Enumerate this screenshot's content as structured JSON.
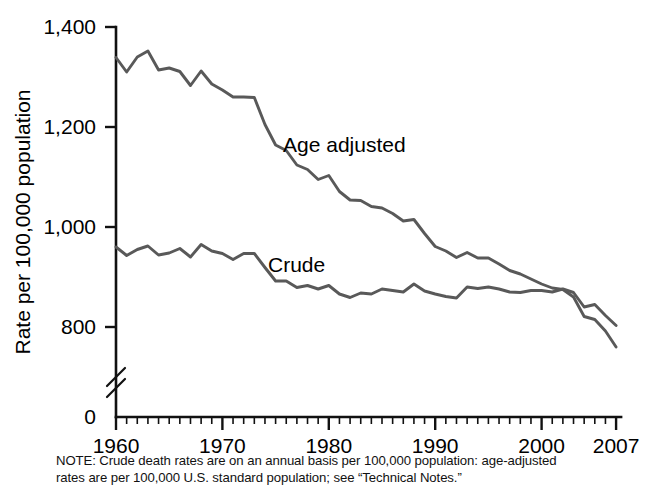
{
  "chart_data": {
    "type": "line",
    "title": "",
    "subtitle": "",
    "xlabel": "",
    "ylabel": "Rate per 100,000 population",
    "xlim": [
      1960,
      2007
    ],
    "ylim": [
      750,
      1400
    ],
    "yzero_label": "0",
    "axis_break": true,
    "grid": false,
    "legend_position": "inline-labels",
    "y_ticks": [
      800,
      1000,
      1200,
      1400
    ],
    "y_tick_labels": [
      "800",
      "1,000",
      "1,200",
      "1,400"
    ],
    "x_ticks": [
      1960,
      1970,
      1980,
      1990,
      2000,
      2007
    ],
    "x_tick_labels": [
      "1960",
      "1970",
      "1980",
      "1990",
      "2000",
      "2007"
    ],
    "x_minor_tick_interval": 1,
    "x": [
      1960,
      1961,
      1962,
      1963,
      1964,
      1965,
      1966,
      1967,
      1968,
      1969,
      1970,
      1971,
      1972,
      1973,
      1974,
      1975,
      1976,
      1977,
      1978,
      1979,
      1980,
      1981,
      1982,
      1983,
      1984,
      1985,
      1986,
      1987,
      1988,
      1989,
      1990,
      1991,
      1992,
      1993,
      1994,
      1995,
      1996,
      1997,
      1998,
      1999,
      2000,
      2001,
      2002,
      2003,
      2004,
      2005,
      2006,
      2007
    ],
    "series": [
      {
        "name": "Age adjusted",
        "label": "Age adjusted",
        "color": "#595959",
        "values": [
          1339,
          1310,
          1340,
          1352,
          1314,
          1318,
          1311,
          1283,
          1312,
          1286,
          1274,
          1260,
          1260,
          1259,
          1205,
          1164,
          1153,
          1124,
          1115,
          1095,
          1103,
          1071,
          1054,
          1053,
          1041,
          1038,
          1027,
          1012,
          1015,
          987,
          961,
          952,
          939,
          949,
          938,
          938,
          926,
          913,
          906,
          896,
          886,
          878,
          875,
          860,
          821,
          815,
          792,
          760
        ]
      },
      {
        "name": "Crude",
        "label": "Crude",
        "color": "#595959",
        "values": [
          960,
          943,
          955,
          962,
          944,
          948,
          957,
          940,
          965,
          952,
          947,
          935,
          947,
          947,
          919,
          892,
          892,
          879,
          883,
          876,
          883,
          866,
          859,
          868,
          866,
          876,
          873,
          870,
          886,
          872,
          866,
          861,
          858,
          880,
          877,
          880,
          876,
          870,
          869,
          873,
          873,
          870,
          876,
          869,
          840,
          845,
          823,
          803
        ]
      }
    ],
    "note_lines": [
      "NOTE: Crude death rates are on an annual basis per 100,000 population: age-adjusted",
      "rates are per 100,000 U.S. standard population; see “Technical Notes.”"
    ]
  },
  "geometry": {
    "plot_left": 116,
    "plot_right": 616,
    "y_top_px": 27,
    "y_top_value": 1400,
    "px_per_unit": 0.5,
    "x_axis_y": 417,
    "x_left_year": 1960,
    "px_per_year": 10.64
  }
}
